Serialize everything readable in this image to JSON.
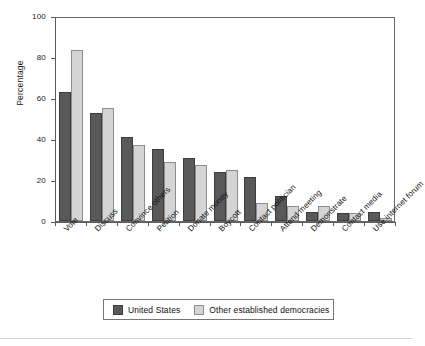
{
  "chart_data": {
    "type": "bar",
    "title": "",
    "xlabel": "",
    "ylabel": "Percentage",
    "ylim": [
      0,
      100
    ],
    "yticks": [
      0,
      20,
      40,
      60,
      80,
      100
    ],
    "ytick_labels": [
      "0",
      "20",
      "40",
      "60",
      "80",
      "100"
    ],
    "grid": false,
    "legend_position": "bottom-center",
    "categories": [
      "Vote",
      "Discuss",
      "Convince others",
      "Petition",
      "Donate money",
      "Boycott",
      "Contact politician",
      "Attend meeting",
      "Demonstrate",
      "Contact media",
      "Use internet forum"
    ],
    "series": [
      {
        "name": "United States",
        "color": "#595959",
        "values": [
          63,
          52.5,
          41,
          35,
          30.5,
          24,
          21.5,
          12,
          4.5,
          4,
          4.5
        ]
      },
      {
        "name": "Other established democracies",
        "color": "#d4d4d4",
        "values": [
          83.5,
          55,
          37,
          29,
          27.5,
          25,
          9,
          7.5,
          7.5,
          4,
          1.5
        ]
      }
    ]
  },
  "legend": {
    "items": [
      {
        "label": "United States",
        "swatch": "dark-gray-swatch"
      },
      {
        "label": "Other established democracies",
        "swatch": "light-gray-swatch"
      }
    ]
  },
  "colors": {
    "united_states": "#595959",
    "other_democracies": "#d4d4d4",
    "axis": "#5a5a5a",
    "frame": "#6a6a6a",
    "background": "#ffffff"
  }
}
